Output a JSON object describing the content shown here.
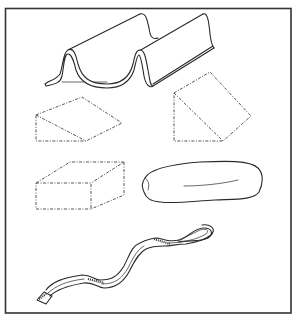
{
  "figure": {
    "background": "#ffffff",
    "line_color": "#2a2a2a",
    "frame": {
      "x": 5,
      "y": 8,
      "width": 286,
      "height": 305
    },
    "items": [
      {
        "name": "wave-foam-support",
        "style": "solid"
      },
      {
        "name": "wedge-low",
        "style": "dashed"
      },
      {
        "name": "wedge-tall",
        "style": "dashed"
      },
      {
        "name": "rectangular-block",
        "style": "dashed"
      },
      {
        "name": "foam-roll",
        "style": "solid"
      },
      {
        "name": "strap-with-buckle",
        "style": "solid"
      }
    ]
  }
}
